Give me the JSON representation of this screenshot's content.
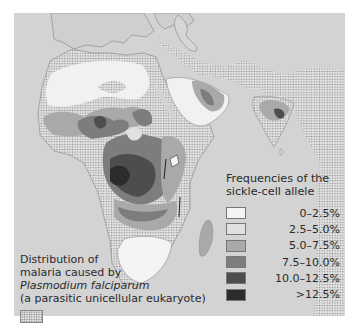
{
  "map": {
    "region": "Africa, Middle East and South Asia",
    "background_color": "#d3d3d3"
  },
  "frequency_legend": {
    "title_line1": "Frequencies of the",
    "title_line2": "sickle-cell allele",
    "items": [
      {
        "label": "0–2.5%",
        "color": "#f4f4f4"
      },
      {
        "label": "2.5–5.0%",
        "color": "#e0e0e0"
      },
      {
        "label": "5.0–7.5%",
        "color": "#a9a9a9"
      },
      {
        "label": "7.5–10.0%",
        "color": "#7d7d7d"
      },
      {
        "label": "10.0–12.5%",
        "color": "#4d4d4d"
      },
      {
        "label": ">12.5%",
        "color": "#2c2c2c"
      }
    ]
  },
  "malaria_legend": {
    "line1": "Distribution of",
    "line2": "malaria caused by",
    "line3": "Plasmodium falciparum",
    "line4": "(a parasitic unicellular eukaryote)",
    "pattern": "stippled"
  }
}
